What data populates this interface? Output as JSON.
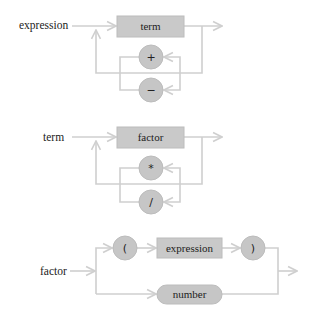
{
  "diagram": {
    "type": "railroad-syntax-diagram",
    "colors": {
      "line": "#cfcfcf",
      "box_fill": "#c9c9c9",
      "circle_fill": "#c6c6c6",
      "text": "#222222"
    },
    "rules": [
      {
        "name": "expression",
        "nonterminal": "term",
        "operators": [
          "+",
          "−"
        ]
      },
      {
        "name": "term",
        "nonterminal": "factor",
        "operators": [
          "*",
          "/"
        ]
      },
      {
        "name": "factor",
        "branch_top": [
          "(",
          "expression",
          ")"
        ],
        "branch_bottom": "number"
      }
    ]
  }
}
